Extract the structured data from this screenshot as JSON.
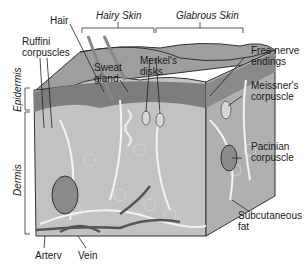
{
  "diagram": {
    "regions": {
      "hairy_skin": "Hairy Skin",
      "glabrous_skin": "Glabrous Skin"
    },
    "layers": {
      "epidermis": "Epidermis",
      "dermis": "Dermis"
    },
    "labels": {
      "hair": "Hair",
      "ruffini_1": "Ruffini",
      "ruffini_2": "corpuscles",
      "sweat_1": "Sweat",
      "sweat_2": "gland",
      "merkel_1": "Merkel's",
      "merkel_2": "disks",
      "free_1": "Free nerve",
      "free_2": "endings",
      "meissner_1": "Meissner's",
      "meissner_2": "corpuscle",
      "pacinian_1": "Pacinian",
      "pacinian_2": "corpuscle",
      "subcut_1": "Subcutaneous",
      "subcut_2": "fat",
      "artery": "Arterv",
      "vein": "Vein"
    },
    "colors": {
      "block_fill": "#b9b9b9",
      "epidermis_top": "#a8a8a8",
      "epidermis_dark": "#7a7a7a",
      "dermis": "#c4c4c4",
      "fat": "#cfcfcf",
      "nerve": "#f2f2f2",
      "vessel": "#555555",
      "outline": "#333333"
    }
  }
}
